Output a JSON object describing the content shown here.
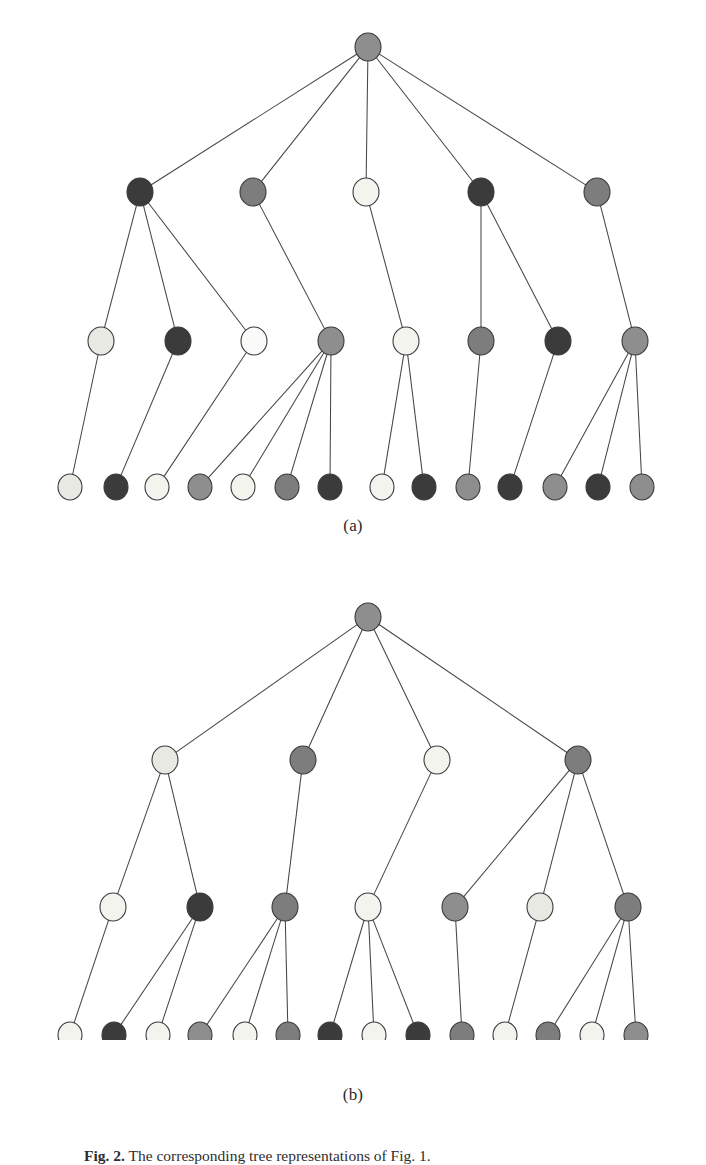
{
  "figure": {
    "caption_label": "Fig. 2.",
    "caption_text": "The corresponding tree representations of Fig. 1.",
    "caption_full": "Fig. 2. The corresponding tree representations of Fig. 1."
  },
  "palette": {
    "white": "#fbfbf9",
    "near_white": "#f4f4ef",
    "light_gray": "#e9e9e4",
    "mid_gray": "#8e8e8e",
    "gray": "#7d7d7d",
    "dark_gray": "#4a4a4a",
    "darkest": "#3b3b3b",
    "edge": "#45464a",
    "outline": "#3a3b3f",
    "background": "#ffffff"
  },
  "panels": [
    {
      "id": "a",
      "label": "(a)",
      "node_radius": 13,
      "leaf_radius": 12,
      "levels": [
        {
          "name": "root",
          "y": 47,
          "nodes": [
            {
              "id": "a-r",
              "x": 368,
              "shade": "mid_gray"
            }
          ]
        },
        {
          "name": "level-1",
          "y": 192,
          "nodes": [
            {
              "id": "a-1-1",
              "x": 140,
              "shade": "darkest"
            },
            {
              "id": "a-1-2",
              "x": 253,
              "shade": "gray"
            },
            {
              "id": "a-1-3",
              "x": 366,
              "shade": "near_white"
            },
            {
              "id": "a-1-4",
              "x": 481,
              "shade": "darkest"
            },
            {
              "id": "a-1-5",
              "x": 597,
              "shade": "gray"
            }
          ]
        },
        {
          "name": "level-2",
          "y": 341,
          "nodes": [
            {
              "id": "a-2-1",
              "x": 101,
              "shade": "light_gray"
            },
            {
              "id": "a-2-2",
              "x": 178,
              "shade": "darkest"
            },
            {
              "id": "a-2-3",
              "x": 254,
              "shade": "white"
            },
            {
              "id": "a-2-4",
              "x": 331,
              "shade": "mid_gray"
            },
            {
              "id": "a-2-5",
              "x": 406,
              "shade": "near_white"
            },
            {
              "id": "a-2-6",
              "x": 481,
              "shade": "gray"
            },
            {
              "id": "a-2-7",
              "x": 558,
              "shade": "darkest"
            },
            {
              "id": "a-2-8",
              "x": 635,
              "shade": "mid_gray"
            }
          ]
        },
        {
          "name": "leaves",
          "y": 487,
          "nodes": [
            {
              "id": "a-3-1",
              "x": 70,
              "shade": "light_gray"
            },
            {
              "id": "a-3-2",
              "x": 116,
              "shade": "darkest"
            },
            {
              "id": "a-3-3",
              "x": 157,
              "shade": "near_white"
            },
            {
              "id": "a-3-4",
              "x": 200,
              "shade": "mid_gray"
            },
            {
              "id": "a-3-5",
              "x": 243,
              "shade": "near_white"
            },
            {
              "id": "a-3-6",
              "x": 287,
              "shade": "gray"
            },
            {
              "id": "a-3-7",
              "x": 330,
              "shade": "darkest"
            },
            {
              "id": "a-3-8",
              "x": 382,
              "shade": "near_white"
            },
            {
              "id": "a-3-9",
              "x": 424,
              "shade": "darkest"
            },
            {
              "id": "a-3-10",
              "x": 468,
              "shade": "mid_gray"
            },
            {
              "id": "a-3-11",
              "x": 510,
              "shade": "darkest"
            },
            {
              "id": "a-3-12",
              "x": 555,
              "shade": "mid_gray"
            },
            {
              "id": "a-3-13",
              "x": 598,
              "shade": "darkest"
            },
            {
              "id": "a-3-14",
              "x": 642,
              "shade": "mid_gray"
            }
          ]
        }
      ],
      "edges": [
        [
          "a-r",
          "a-1-1"
        ],
        [
          "a-r",
          "a-1-2"
        ],
        [
          "a-r",
          "a-1-3"
        ],
        [
          "a-r",
          "a-1-4"
        ],
        [
          "a-r",
          "a-1-5"
        ],
        [
          "a-1-1",
          "a-2-1"
        ],
        [
          "a-1-1",
          "a-2-2"
        ],
        [
          "a-1-1",
          "a-2-3"
        ],
        [
          "a-1-2",
          "a-2-4"
        ],
        [
          "a-1-3",
          "a-2-5"
        ],
        [
          "a-1-4",
          "a-2-6"
        ],
        [
          "a-1-4",
          "a-2-7"
        ],
        [
          "a-1-5",
          "a-2-8"
        ],
        [
          "a-2-1",
          "a-3-1"
        ],
        [
          "a-2-2",
          "a-3-2"
        ],
        [
          "a-2-3",
          "a-3-3"
        ],
        [
          "a-2-4",
          "a-3-4"
        ],
        [
          "a-2-4",
          "a-3-5"
        ],
        [
          "a-2-4",
          "a-3-6"
        ],
        [
          "a-2-4",
          "a-3-7"
        ],
        [
          "a-2-5",
          "a-3-8"
        ],
        [
          "a-2-5",
          "a-3-9"
        ],
        [
          "a-2-6",
          "a-3-10"
        ],
        [
          "a-2-7",
          "a-3-11"
        ],
        [
          "a-2-8",
          "a-3-12"
        ],
        [
          "a-2-8",
          "a-3-13"
        ],
        [
          "a-2-8",
          "a-3-14"
        ]
      ]
    },
    {
      "id": "b",
      "label": "(b)",
      "node_radius": 13,
      "leaf_radius": 12,
      "levels": [
        {
          "name": "root",
          "y": 47,
          "nodes": [
            {
              "id": "b-r",
              "x": 368,
              "shade": "mid_gray"
            }
          ]
        },
        {
          "name": "level-1",
          "y": 190,
          "nodes": [
            {
              "id": "b-1-1",
              "x": 165,
              "shade": "light_gray"
            },
            {
              "id": "b-1-2",
              "x": 303,
              "shade": "gray"
            },
            {
              "id": "b-1-3",
              "x": 437,
              "shade": "near_white"
            },
            {
              "id": "b-1-4",
              "x": 578,
              "shade": "gray"
            }
          ]
        },
        {
          "name": "level-2",
          "y": 337,
          "nodes": [
            {
              "id": "b-2-1",
              "x": 113,
              "shade": "near_white"
            },
            {
              "id": "b-2-2",
              "x": 200,
              "shade": "darkest"
            },
            {
              "id": "b-2-3",
              "x": 285,
              "shade": "gray"
            },
            {
              "id": "b-2-4",
              "x": 368,
              "shade": "near_white"
            },
            {
              "id": "b-2-5",
              "x": 455,
              "shade": "mid_gray"
            },
            {
              "id": "b-2-6",
              "x": 540,
              "shade": "light_gray"
            },
            {
              "id": "b-2-7",
              "x": 628,
              "shade": "gray"
            }
          ]
        },
        {
          "name": "leaves",
          "y": 465,
          "nodes": [
            {
              "id": "b-3-1",
              "x": 70,
              "shade": "near_white"
            },
            {
              "id": "b-3-2",
              "x": 114,
              "shade": "darkest"
            },
            {
              "id": "b-3-3",
              "x": 158,
              "shade": "near_white"
            },
            {
              "id": "b-3-4",
              "x": 200,
              "shade": "mid_gray"
            },
            {
              "id": "b-3-5",
              "x": 245,
              "shade": "near_white"
            },
            {
              "id": "b-3-6",
              "x": 288,
              "shade": "gray"
            },
            {
              "id": "b-3-7",
              "x": 330,
              "shade": "darkest"
            },
            {
              "id": "b-3-8",
              "x": 374,
              "shade": "near_white"
            },
            {
              "id": "b-3-9",
              "x": 418,
              "shade": "darkest"
            },
            {
              "id": "b-3-10",
              "x": 462,
              "shade": "gray"
            },
            {
              "id": "b-3-11",
              "x": 505,
              "shade": "near_white"
            },
            {
              "id": "b-3-12",
              "x": 548,
              "shade": "gray"
            },
            {
              "id": "b-3-13",
              "x": 592,
              "shade": "near_white"
            },
            {
              "id": "b-3-14",
              "x": 636,
              "shade": "mid_gray"
            }
          ]
        }
      ],
      "edges": [
        [
          "b-r",
          "b-1-1"
        ],
        [
          "b-r",
          "b-1-2"
        ],
        [
          "b-r",
          "b-1-3"
        ],
        [
          "b-r",
          "b-1-4"
        ],
        [
          "b-1-1",
          "b-2-1"
        ],
        [
          "b-1-1",
          "b-2-2"
        ],
        [
          "b-1-2",
          "b-2-3"
        ],
        [
          "b-1-3",
          "b-2-4"
        ],
        [
          "b-1-4",
          "b-2-5"
        ],
        [
          "b-1-4",
          "b-2-6"
        ],
        [
          "b-1-4",
          "b-2-7"
        ],
        [
          "b-2-1",
          "b-3-1"
        ],
        [
          "b-2-2",
          "b-3-2"
        ],
        [
          "b-2-2",
          "b-3-3"
        ],
        [
          "b-2-3",
          "b-3-4"
        ],
        [
          "b-2-3",
          "b-3-5"
        ],
        [
          "b-2-3",
          "b-3-6"
        ],
        [
          "b-2-4",
          "b-3-7"
        ],
        [
          "b-2-4",
          "b-3-8"
        ],
        [
          "b-2-4",
          "b-3-9"
        ],
        [
          "b-2-5",
          "b-3-10"
        ],
        [
          "b-2-6",
          "b-3-11"
        ],
        [
          "b-2-7",
          "b-3-12"
        ],
        [
          "b-2-7",
          "b-3-13"
        ],
        [
          "b-2-7",
          "b-3-14"
        ]
      ]
    }
  ]
}
